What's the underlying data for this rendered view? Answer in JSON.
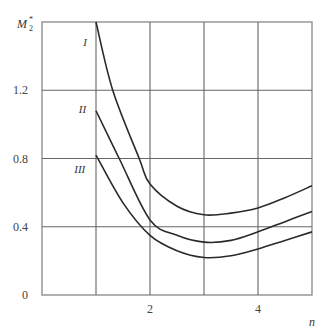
{
  "chart_data": {
    "type": "line",
    "title": "",
    "xlabel": "n",
    "ylabel": "M2*",
    "ylabel_main": "M",
    "ylabel_sub": "2",
    "ylabel_sup": "*",
    "xlim": [
      0,
      5
    ],
    "ylim": [
      0,
      1.6
    ],
    "grid": true,
    "x_ticks": [
      2,
      4
    ],
    "x_tick_labels": [
      "2",
      "4"
    ],
    "y_ticks": [
      0,
      0.4,
      0.8,
      1.2
    ],
    "y_tick_labels": [
      "0",
      "0.4",
      "0.8",
      "1.2"
    ],
    "x_gridlines": [
      1,
      2,
      3,
      4
    ],
    "y_gridlines": [
      0.4,
      0.8,
      1.2
    ],
    "series": [
      {
        "name": "I",
        "x": [
          1.0,
          1.31,
          1.8,
          2.0,
          2.5,
          3.0,
          3.5,
          4.0,
          4.5,
          5.0
        ],
        "values": [
          1.6,
          1.2,
          0.8,
          0.65,
          0.52,
          0.47,
          0.48,
          0.51,
          0.57,
          0.64
        ]
      },
      {
        "name": "II",
        "x": [
          1.0,
          1.43,
          2.0,
          2.5,
          3.0,
          3.5,
          4.0,
          4.5,
          5.0
        ],
        "values": [
          1.08,
          0.8,
          0.44,
          0.35,
          0.31,
          0.32,
          0.37,
          0.43,
          0.49
        ]
      },
      {
        "name": "III",
        "x": [
          1.0,
          1.5,
          2.0,
          2.5,
          3.0,
          3.5,
          4.0,
          4.5,
          5.0
        ],
        "values": [
          0.82,
          0.54,
          0.35,
          0.26,
          0.22,
          0.23,
          0.27,
          0.32,
          0.37
        ]
      }
    ],
    "annotations": [
      {
        "text": "I",
        "x": 0.8,
        "y": 1.48
      },
      {
        "text": "II",
        "x": 0.75,
        "y": 1.09
      },
      {
        "text": "III",
        "x": 0.7,
        "y": 0.74
      }
    ]
  }
}
